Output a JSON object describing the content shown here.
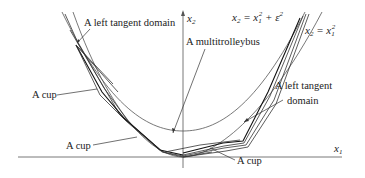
{
  "figure": {
    "axes": {
      "x_label": "x",
      "x_label_sub": "1",
      "y_label": "x",
      "y_label_sub": "2"
    },
    "curves": {
      "inner": {
        "lhs": "x",
        "lhs_sub": "2",
        "eq": " = x",
        "eq_sub": "1",
        "sup": "2",
        "tail": " + ε",
        "tail_sup": "2"
      },
      "outer": {
        "lhs": "x",
        "lhs_sub": "2",
        "eq": " = x",
        "eq_sub": "1",
        "sup": "2"
      }
    },
    "annotations": [
      {
        "id": "left-tangent-domain-top",
        "text": "A left tangent domain"
      },
      {
        "id": "multitrolleybus",
        "text": "A multitrolleybus"
      },
      {
        "id": "cup-left-upper",
        "text": "A cup"
      },
      {
        "id": "cup-left-lower",
        "text": "A cup"
      },
      {
        "id": "cup-bottom-right",
        "text": "A cup"
      },
      {
        "id": "left-tangent-domain-right-1",
        "text": "A left tangent"
      },
      {
        "id": "left-tangent-domain-right-2",
        "text": "domain"
      }
    ]
  }
}
